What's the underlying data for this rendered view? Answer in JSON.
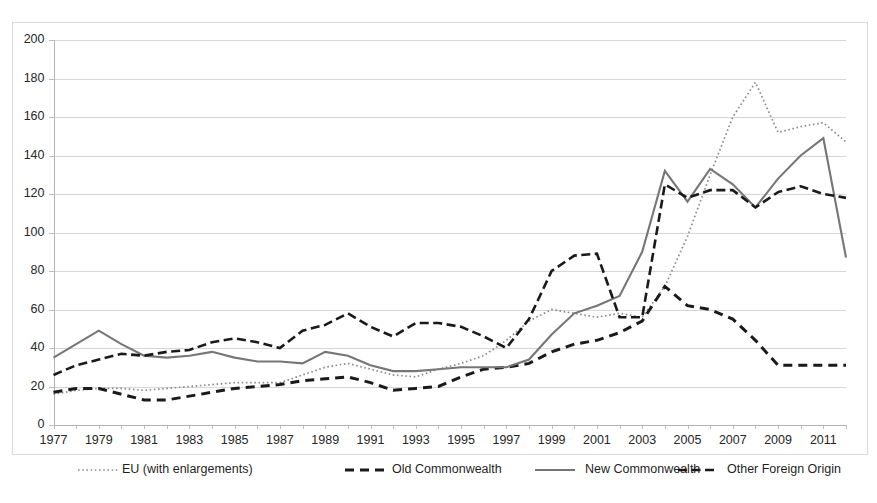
{
  "chart_data": {
    "type": "line",
    "title": "",
    "subtitle": "",
    "xlabel": "",
    "ylabel": "",
    "xlim": [
      1977,
      2012
    ],
    "ylim": [
      0,
      200
    ],
    "ytick_step": 20,
    "grid": true,
    "legend_position": "bottom",
    "yticks": [
      "0",
      "20",
      "40",
      "60",
      "80",
      "100",
      "120",
      "140",
      "160",
      "180",
      "200"
    ],
    "xticks": [
      "1977",
      "1979",
      "1981",
      "1983",
      "1985",
      "1987",
      "1989",
      "1991",
      "1993",
      "1995",
      "1997",
      "1999",
      "2001",
      "2003",
      "2005",
      "2007",
      "2009",
      "2011"
    ],
    "x": [
      1977,
      1978,
      1979,
      1980,
      1981,
      1982,
      1983,
      1984,
      1985,
      1986,
      1987,
      1988,
      1989,
      1990,
      1991,
      1992,
      1993,
      1994,
      1995,
      1996,
      1997,
      1998,
      1999,
      2000,
      2001,
      2002,
      2003,
      2004,
      2005,
      2006,
      2007,
      2008,
      2009,
      2010,
      2011,
      2012
    ],
    "series": [
      {
        "name": "EU (with enlargements)",
        "style": "dotted",
        "color": "#8c8c8c",
        "values": [
          16,
          18,
          19,
          19,
          18,
          19,
          20,
          21,
          22,
          22,
          22,
          26,
          30,
          32,
          29,
          26,
          25,
          29,
          32,
          36,
          44,
          54,
          60,
          58,
          56,
          58,
          56,
          72,
          98,
          130,
          160,
          178,
          152,
          155,
          157,
          147
        ]
      },
      {
        "name": "Old Commonwealth",
        "style": "dashed",
        "color": "#1a1a1a",
        "values": [
          17,
          19,
          19,
          16,
          13,
          13,
          15,
          17,
          19,
          20,
          21,
          23,
          24,
          25,
          22,
          18,
          19,
          20,
          25,
          29,
          30,
          32,
          38,
          42,
          44,
          48,
          54,
          72,
          62,
          60,
          55,
          44,
          31,
          31,
          31,
          31
        ]
      },
      {
        "name": "New Commonwealth",
        "style": "solid",
        "color": "#767676",
        "values": [
          35,
          42,
          49,
          42,
          36,
          35,
          36,
          38,
          35,
          33,
          33,
          32,
          38,
          36,
          31,
          28,
          28,
          29,
          30,
          30,
          30,
          34,
          47,
          58,
          62,
          67,
          90,
          132,
          116,
          133,
          125,
          113,
          128,
          140,
          149,
          87
        ]
      },
      {
        "name": "Other Foreign Origin",
        "style": "dash-dot",
        "color": "#1a1a1a",
        "values": [
          26,
          31,
          34,
          37,
          36,
          38,
          39,
          43,
          45,
          43,
          40,
          49,
          52,
          58,
          51,
          46,
          53,
          53,
          51,
          46,
          40,
          55,
          80,
          88,
          89,
          56,
          56,
          125,
          118,
          122,
          122,
          113,
          121,
          124,
          120,
          118
        ]
      }
    ]
  },
  "legend": {
    "items": [
      {
        "label": "EU (with enlargements)",
        "style": "dotted"
      },
      {
        "label": "Old Commonwealth",
        "style": "dashed"
      },
      {
        "label": "New Commonwealth",
        "style": "solid"
      },
      {
        "label": "Other Foreign Origin",
        "style": "dash-dot"
      }
    ]
  }
}
